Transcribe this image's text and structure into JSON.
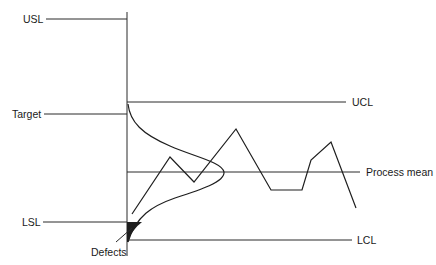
{
  "diagram": {
    "title": "",
    "spec_limits": {
      "usl": "USL",
      "target": "Target",
      "lsl": "LSL"
    },
    "control_limits": {
      "ucl": "UCL",
      "process_mean": "Process mean",
      "lcl": "LCL"
    },
    "annotations": {
      "defects": "Defects"
    },
    "colors": {
      "line": "#2a2a2a",
      "defect_fill": "#1e1e1e",
      "background": "#ffffff"
    }
  }
}
